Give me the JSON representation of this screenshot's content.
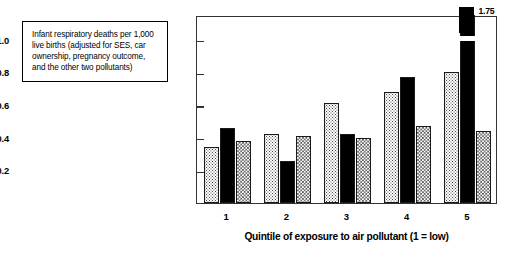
{
  "caption": {
    "text": "Infant respiratory deaths per 1,000 live births (adjusted for SES, car ownership, pregnancy outcome, and the other two pollutants)"
  },
  "legend": {
    "items": [
      {
        "label": "Total suspended\nparticulates",
        "pattern": "dotted",
        "color": "#4a4a4a"
      },
      {
        "label": "SO2",
        "label_base": "SO",
        "label_sub": "2",
        "pattern": "solid",
        "color": "#000000"
      },
      {
        "label": "Nitrogen oxides",
        "pattern": "checker",
        "color": "#555555"
      }
    ]
  },
  "annotations": [
    {
      "text": "1.75",
      "series": "SO2",
      "category": "5",
      "value": 1.75
    }
  ],
  "chart_data": {
    "type": "bar",
    "title": "",
    "xlabel": "Quintile of exposure to air pollutant (1 = low)",
    "ylabel": "",
    "categories": [
      "1",
      "2",
      "3",
      "4",
      "5"
    ],
    "yticks": [
      "0.2",
      "0.4",
      "0.6",
      "0.8",
      "1.0"
    ],
    "ytick_values": [
      0.2,
      0.4,
      0.6,
      0.8,
      1.0
    ],
    "ylim": [
      0,
      1.15
    ],
    "grid": false,
    "legend_position": "top-right-inside",
    "series": [
      {
        "name": "Total suspended particulates",
        "values": [
          0.34,
          0.42,
          0.61,
          0.68,
          0.8
        ]
      },
      {
        "name": "SO2",
        "values": [
          0.46,
          0.26,
          0.42,
          0.77,
          1.75
        ]
      },
      {
        "name": "Nitrogen oxides",
        "values": [
          0.38,
          0.41,
          0.4,
          0.47,
          0.44
        ]
      }
    ]
  }
}
